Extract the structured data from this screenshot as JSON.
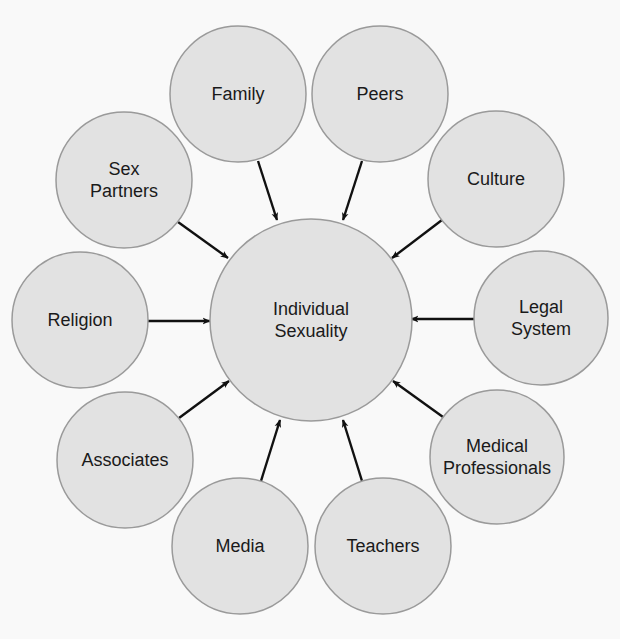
{
  "diagram": {
    "type": "hub-and-spoke",
    "center": {
      "id": "individual-sexuality",
      "lines": [
        "Individual",
        "Sexuality"
      ],
      "cx": 311,
      "cy": 320,
      "r": 101
    },
    "colors": {
      "node_fill": "#e2e2e2",
      "node_stroke": "#9a9a9a",
      "arrow": "#111111",
      "text": "#1a1a1a",
      "background": "#f9f9f9"
    },
    "nodes": [
      {
        "id": "family",
        "lines": [
          "Family"
        ],
        "cx": 238,
        "cy": 94,
        "r": 68,
        "arrow": [
          258,
          161,
          277,
          220
        ]
      },
      {
        "id": "peers",
        "lines": [
          "Peers"
        ],
        "cx": 380,
        "cy": 94,
        "r": 68,
        "arrow": [
          362,
          161,
          343,
          220
        ]
      },
      {
        "id": "culture",
        "lines": [
          "Culture"
        ],
        "cx": 496,
        "cy": 179,
        "r": 68,
        "arrow": [
          442,
          220,
          392,
          258
        ]
      },
      {
        "id": "legal-system",
        "lines": [
          "Legal",
          "System"
        ],
        "cx": 541,
        "cy": 318,
        "r": 67,
        "arrow": [
          474,
          319,
          411,
          319
        ]
      },
      {
        "id": "medical-professionals",
        "lines": [
          "Medical",
          "Professionals"
        ],
        "cx": 497,
        "cy": 457,
        "r": 67,
        "arrow": [
          443,
          417,
          393,
          381
        ]
      },
      {
        "id": "teachers",
        "lines": [
          "Teachers"
        ],
        "cx": 383,
        "cy": 546,
        "r": 68,
        "arrow": [
          362,
          481,
          343,
          420
        ]
      },
      {
        "id": "media",
        "lines": [
          "Media"
        ],
        "cx": 240,
        "cy": 546,
        "r": 68,
        "arrow": [
          261,
          481,
          280,
          420
        ]
      },
      {
        "id": "associates",
        "lines": [
          "Associates"
        ],
        "cx": 125,
        "cy": 460,
        "r": 68,
        "arrow": [
          179,
          418,
          229,
          381
        ]
      },
      {
        "id": "religion",
        "lines": [
          "Religion"
        ],
        "cx": 80,
        "cy": 320,
        "r": 68,
        "arrow": [
          148,
          321,
          210,
          321
        ]
      },
      {
        "id": "sex-partners",
        "lines": [
          "Sex",
          "Partners"
        ],
        "cx": 124,
        "cy": 180,
        "r": 68,
        "arrow": [
          178,
          222,
          228,
          258
        ]
      }
    ]
  }
}
